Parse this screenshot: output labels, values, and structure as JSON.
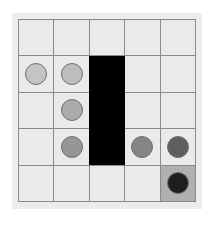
{
  "board": {
    "rows": 5,
    "cols": 5,
    "goal_cell": {
      "row": 4,
      "col": 4,
      "color": "#b0b0b0"
    },
    "wall": {
      "col": 2,
      "row_start": 1,
      "row_end": 3,
      "color": "#000000"
    },
    "pieces": [
      {
        "row": 1,
        "col": 0,
        "color": "#c4c4c4"
      },
      {
        "row": 1,
        "col": 1,
        "color": "#bebebe"
      },
      {
        "row": 2,
        "col": 1,
        "color": "#ababab"
      },
      {
        "row": 3,
        "col": 1,
        "color": "#969696"
      },
      {
        "row": 3,
        "col": 3,
        "color": "#858585"
      },
      {
        "row": 3,
        "col": 4,
        "color": "#5e5e5e"
      },
      {
        "row": 4,
        "col": 4,
        "color": "#1e1e1e"
      }
    ]
  }
}
